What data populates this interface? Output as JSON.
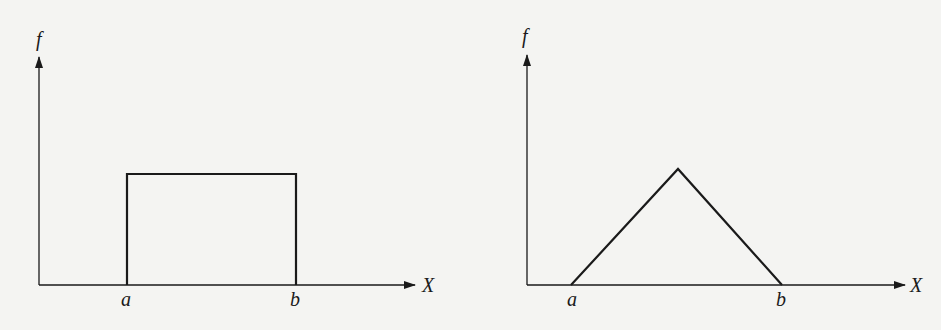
{
  "figures": [
    {
      "id": "uniform",
      "shape": "rectangle",
      "y_axis_label": "f",
      "x_axis_label": "X",
      "x_tick_labels": [
        "a",
        "b"
      ],
      "geometry": {
        "origin": [
          39,
          285
        ],
        "y_axis_top": 57,
        "x_axis_end": 415,
        "a_x": 127,
        "b_x": 296,
        "top_y": 174
      }
    },
    {
      "id": "triangular",
      "shape": "triangle",
      "y_axis_label": "f",
      "x_axis_label": "X",
      "x_tick_labels": [
        "a",
        "b"
      ],
      "geometry": {
        "origin": [
          527,
          285
        ],
        "y_axis_top": 55,
        "x_axis_end": 905,
        "a_x": 571,
        "b_x": 782,
        "peak": [
          678,
          169
        ]
      }
    }
  ],
  "colors": {
    "ink": "#1a1a1a",
    "background": "#f4f4f2"
  }
}
